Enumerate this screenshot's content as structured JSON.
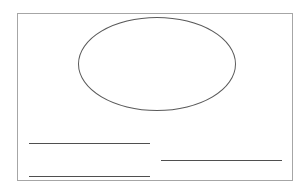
{
  "diagram": {
    "colors": {
      "background": "#ffffff",
      "frame_border": "#a6a6a6",
      "ellipse_stroke": "#5a5a5a",
      "line_stroke": "#4f4f4f"
    },
    "shapes": [
      {
        "type": "rectangle",
        "name": "outer-frame"
      },
      {
        "type": "ellipse",
        "name": "top-ellipse"
      },
      {
        "type": "line",
        "name": "left-upper-line"
      },
      {
        "type": "line",
        "name": "right-middle-line"
      },
      {
        "type": "line",
        "name": "left-lower-line"
      }
    ]
  }
}
